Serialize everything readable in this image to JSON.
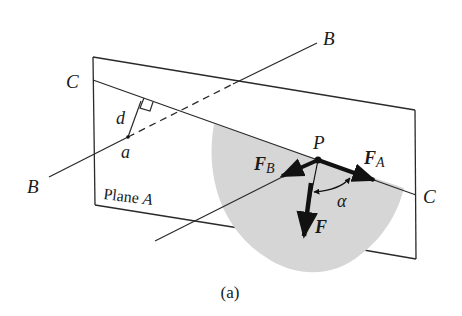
{
  "figure": {
    "caption": "(a)",
    "colors": {
      "line": "#2a2a2a",
      "shade": "#d6d6d6",
      "vector": "#111111",
      "background": "#ffffff"
    },
    "labels": {
      "C_left": "C",
      "C_right": "C",
      "B_top": "B",
      "B_left": "B",
      "d": "d",
      "a": "a",
      "plane": "Plane ",
      "plane_letter": "A",
      "P": "P",
      "F_B": "F",
      "F_B_sub": "B",
      "F_A": "F",
      "F_A_sub": "A",
      "F": "F",
      "alpha": "α"
    },
    "elements": {
      "plane": "Plane A (quadrilateral)",
      "line_C": "Line C lying in plane A",
      "line_B": "Line B passing through plane (dashed behind)",
      "distance_d": "Perpendicular distance d from point a to line C",
      "point_P": "Point P on line C",
      "vectors": [
        "F_B",
        "F_A",
        "F"
      ],
      "angle": "α between F and F_A"
    }
  }
}
